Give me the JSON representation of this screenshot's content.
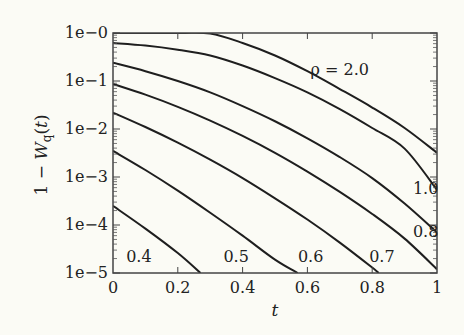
{
  "chart_data": {
    "type": "line",
    "title": "",
    "xlabel": "t",
    "ylabel": "1 − W_q(t)",
    "xscale": "linear",
    "yscale": "log",
    "xlim": [
      0,
      1
    ],
    "ylim": [
      1e-05,
      1
    ],
    "grid": false,
    "legend": "none (inline curve labels)",
    "x_ticks": [
      0,
      0.2,
      0.4,
      0.6,
      0.8,
      1
    ],
    "x_tick_labels": [
      "0",
      "0.2",
      "0.4",
      "0.6",
      "0.8",
      "1"
    ],
    "y_ticks": [
      1,
      0.1,
      0.01,
      0.001,
      0.0001,
      1e-05
    ],
    "y_tick_labels": [
      "1e−0",
      "1e−1",
      "1e−2",
      "1e−3",
      "1e−4",
      "1e−5"
    ],
    "series": [
      {
        "name": "ρ = 2.0",
        "label": "ρ = 2.0",
        "label_pos": [
          0.7,
          0.17
        ],
        "x": [
          0,
          0.2,
          0.3,
          0.4,
          0.5,
          0.6,
          0.7,
          0.8,
          0.9,
          1.0
        ],
        "values": [
          1.0,
          1.0,
          0.97,
          0.62,
          0.34,
          0.16,
          0.068,
          0.028,
          0.0105,
          0.0032
        ]
      },
      {
        "name": "ρ = 1.0",
        "label": "1.0",
        "label_pos": [
          0.965,
          0.00055
        ],
        "x": [
          0,
          0.1,
          0.2,
          0.3,
          0.4,
          0.5,
          0.6,
          0.7,
          0.8,
          0.9,
          1.0
        ],
        "values": [
          0.62,
          0.55,
          0.45,
          0.34,
          0.21,
          0.115,
          0.058,
          0.026,
          0.0105,
          0.0039,
          0.00054
        ]
      },
      {
        "name": "ρ = 0.8",
        "label": "0.8",
        "label_pos": [
          0.965,
          7.2e-05
        ],
        "x": [
          0,
          0.1,
          0.2,
          0.3,
          0.4,
          0.5,
          0.6,
          0.7,
          0.8,
          0.9,
          1.0
        ],
        "values": [
          0.24,
          0.16,
          0.1,
          0.058,
          0.03,
          0.0145,
          0.0064,
          0.0026,
          0.00095,
          0.00028,
          7e-05
        ]
      },
      {
        "name": "ρ = 0.7",
        "label": "0.7",
        "label_pos": [
          0.83,
          2.2e-05
        ],
        "x": [
          0,
          0.1,
          0.2,
          0.3,
          0.4,
          0.5,
          0.6,
          0.7,
          0.8,
          0.9,
          1.0
        ],
        "values": [
          0.087,
          0.052,
          0.029,
          0.015,
          0.0072,
          0.0032,
          0.0013,
          0.00049,
          0.00017,
          5.2e-05,
          1.2e-05
        ]
      },
      {
        "name": "ρ = 0.6",
        "label": "0.6",
        "label_pos": [
          0.61,
          2.2e-05
        ],
        "x": [
          0,
          0.1,
          0.2,
          0.3,
          0.4,
          0.5,
          0.6,
          0.7,
          0.8,
          0.82
        ],
        "values": [
          0.022,
          0.011,
          0.0052,
          0.0023,
          0.00095,
          0.00036,
          0.00013,
          4.3e-05,
          1.3e-05,
          1e-05
        ]
      },
      {
        "name": "ρ = 0.5",
        "label": "0.5",
        "label_pos": [
          0.38,
          2.2e-05
        ],
        "x": [
          0,
          0.1,
          0.2,
          0.3,
          0.4,
          0.5,
          0.57
        ],
        "values": [
          0.0035,
          0.0014,
          0.00052,
          0.00018,
          6e-05,
          1.9e-05,
          1e-05
        ]
      },
      {
        "name": "ρ = 0.4",
        "label": "0.4",
        "label_pos": [
          0.08,
          2.2e-05
        ],
        "x": [
          0,
          0.1,
          0.2,
          0.27
        ],
        "values": [
          0.00025,
          8.4e-05,
          2.6e-05,
          1e-05
        ]
      }
    ]
  },
  "colors": {
    "background": "#fbfbf5",
    "ink": "#222222",
    "frame": "#444444"
  }
}
